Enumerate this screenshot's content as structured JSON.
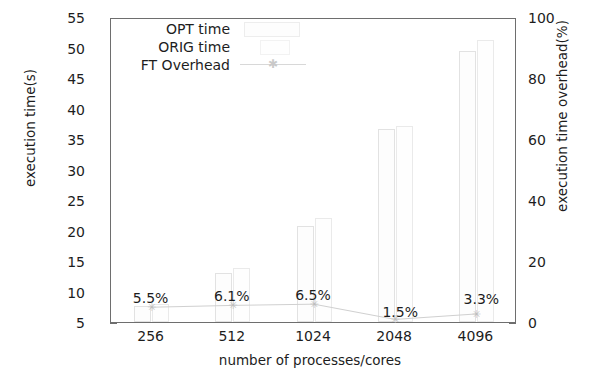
{
  "chart_data": {
    "type": "bar",
    "title": "",
    "xlabel": "number of processes/cores",
    "ylabel": "execution time(s)",
    "ylabel_right": "execution time overhead(%)",
    "categories": [
      "256",
      "512",
      "1024",
      "2048",
      "4096"
    ],
    "ylim": [
      5,
      55
    ],
    "yticks": [
      5,
      10,
      15,
      20,
      25,
      30,
      35,
      40,
      45,
      50,
      55
    ],
    "ylim_right": [
      0,
      100
    ],
    "yticks_right": [
      0,
      20,
      40,
      60,
      80,
      100
    ],
    "yticks_right_minor": [
      10,
      30,
      50,
      70,
      90
    ],
    "grid": false,
    "legend_position": "top-left",
    "series": [
      {
        "name": "OPT time",
        "type": "bar",
        "values": [
          7.6,
          13.0,
          20.7,
          36.6,
          49.5
        ]
      },
      {
        "name": "ORIG time",
        "type": "bar",
        "values": [
          8.0,
          13.8,
          22.0,
          37.2,
          51.2
        ]
      },
      {
        "name": "FT Overhead",
        "type": "line",
        "values": [
          5.5,
          6.1,
          6.5,
          1.5,
          3.3
        ],
        "marker": "star",
        "data_labels": [
          "5.5%",
          "6.1%",
          "6.5%",
          "1.5%",
          "3.3%"
        ]
      }
    ]
  },
  "axes": {
    "left_title": "execution time(s)",
    "right_title": "execution time overhead(%)",
    "bottom_title": "number of processes/cores",
    "left_ticks": [
      "55",
      "50",
      "45",
      "40",
      "35",
      "30",
      "25",
      "20",
      "15",
      "10",
      "5"
    ],
    "right_ticks": [
      "100",
      "80",
      "60",
      "40",
      "20",
      "0"
    ],
    "bottom_ticks": [
      "256",
      "512",
      "1024",
      "2048",
      "4096"
    ]
  },
  "legend": {
    "entries": [
      {
        "label": "OPT time",
        "icon": "bar-swatch-icon"
      },
      {
        "label": "ORIG time",
        "icon": "bar-swatch-icon"
      },
      {
        "label": "FT Overhead",
        "icon": "line-star-marker-icon"
      }
    ]
  },
  "annotations": {
    "overhead_labels": [
      "5.5%",
      "6.1%",
      "6.5%",
      "1.5%",
      "3.3%"
    ]
  },
  "colors": {
    "axis": "#6e6e6e",
    "text": "#1d1d1d",
    "bar_opt_edge": "#e2e2e2",
    "bar_orig_edge": "#eaeaea",
    "line": "#d0d0d0"
  }
}
